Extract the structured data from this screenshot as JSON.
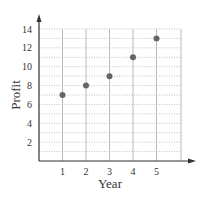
{
  "chart_data": {
    "type": "scatter",
    "title": "",
    "xlabel": "Year",
    "ylabel": "Profit",
    "x": [
      1,
      2,
      3,
      4,
      5
    ],
    "series": [
      {
        "name": "Profit",
        "values": [
          7,
          8,
          9,
          11,
          13
        ]
      }
    ],
    "x_ticks": [
      "1",
      "2",
      "3",
      "4",
      "5"
    ],
    "y_ticks": [
      "2",
      "4",
      "6",
      "8",
      "10",
      "12",
      "14"
    ],
    "xlim": [
      0,
      6
    ],
    "ylim": [
      0,
      14
    ],
    "grid": true,
    "legend": "none"
  }
}
